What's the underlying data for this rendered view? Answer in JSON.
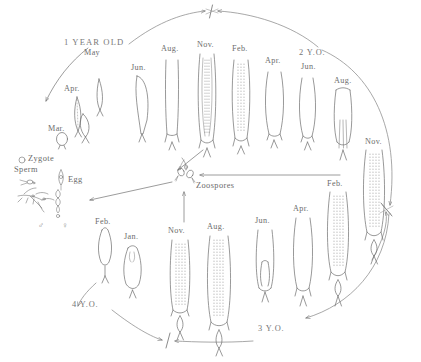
{
  "diagram": {
    "title_label": "1 YEAR OLD",
    "ink_color": "#6d6d6d",
    "background": "#ffffff"
  },
  "stage_labels": {
    "year1": "1 YEAR OLD",
    "year2": "2 Y.O.",
    "year3": "3 Y.O.",
    "year4": "4 Y.O."
  },
  "terms": {
    "zygote": "Zygote",
    "sperm": "Sperm",
    "egg": "Egg",
    "zoospores": "Zoospores",
    "male_symbol": "♂",
    "female_symbol": "♀"
  },
  "months": {
    "row_top": [
      "Mar.",
      "Apr.",
      "May",
      "Jun.",
      "Aug.",
      "Nov.",
      "Feb.",
      "Apr.",
      "Jun.",
      "Aug.",
      "Nov."
    ],
    "row_bottom": [
      "Feb.",
      "Jan.",
      "Nov.",
      "Aug.",
      "Jun.",
      "Apr.",
      "Feb."
    ]
  },
  "specimens": [
    {
      "id": "s-mar",
      "month": "Mar.",
      "x": 57,
      "y": 133,
      "w": 11,
      "h": 13,
      "shape": "blob",
      "row": "top"
    },
    {
      "id": "s-apr1",
      "month": "Apr.",
      "x": 72,
      "y": 96,
      "w": 10,
      "h": 34,
      "shape": "lance",
      "row": "top"
    },
    {
      "id": "s-may1",
      "month": "May",
      "x": 94,
      "y": 78,
      "w": 10,
      "h": 32,
      "shape": "lance",
      "row": "top"
    },
    {
      "id": "s-may2",
      "month": "May",
      "x": 76,
      "y": 113,
      "w": 14,
      "h": 26,
      "shape": "teardrop",
      "row": "top"
    },
    {
      "id": "s-jun1",
      "month": "Jun.",
      "x": 136,
      "y": 74,
      "w": 16,
      "h": 62,
      "shape": "blade",
      "row": "top"
    },
    {
      "id": "s-aug1",
      "month": "Aug.",
      "x": 166,
      "y": 58,
      "w": 16,
      "h": 84,
      "shape": "blade",
      "row": "top"
    },
    {
      "id": "s-nov1",
      "month": "Nov.",
      "x": 199,
      "y": 52,
      "w": 18,
      "h": 92,
      "shape": "sorus",
      "row": "top"
    },
    {
      "id": "s-feb1",
      "month": "Feb.",
      "x": 232,
      "y": 58,
      "w": 18,
      "h": 86,
      "shape": "sorus",
      "row": "top"
    },
    {
      "id": "s-apr2",
      "month": "Apr.",
      "x": 266,
      "y": 70,
      "w": 16,
      "h": 72,
      "shape": "blade",
      "row": "top"
    },
    {
      "id": "s-jun2",
      "month": "Jun.",
      "x": 300,
      "y": 76,
      "w": 14,
      "h": 68,
      "shape": "blade",
      "row": "top"
    },
    {
      "id": "s-aug2",
      "month": "Aug.",
      "x": 334,
      "y": 88,
      "w": 16,
      "h": 76,
      "shape": "split",
      "row": "top"
    },
    {
      "id": "s-nov2",
      "month": "Nov.",
      "x": 366,
      "y": 148,
      "w": 20,
      "h": 88,
      "shape": "sorus",
      "row": "right"
    },
    {
      "id": "s-feb2",
      "month": "Feb.",
      "x": 330,
      "y": 190,
      "w": 20,
      "h": 92,
      "shape": "sorus",
      "row": "bottom"
    },
    {
      "id": "s-apr3",
      "month": "Apr.",
      "x": 296,
      "y": 216,
      "w": 16,
      "h": 78,
      "shape": "blade",
      "row": "bottom"
    },
    {
      "id": "s-jun3",
      "month": "Jun.",
      "x": 258,
      "y": 228,
      "w": 16,
      "h": 72,
      "shape": "split",
      "row": "bottom"
    },
    {
      "id": "s-aug3",
      "month": "Aug.",
      "x": 210,
      "y": 234,
      "w": 20,
      "h": 96,
      "shape": "sorus",
      "row": "bottom"
    },
    {
      "id": "s-nov3",
      "month": "Nov.",
      "x": 172,
      "y": 238,
      "w": 18,
      "h": 82,
      "shape": "sorus",
      "row": "bottom"
    },
    {
      "id": "s-jan1",
      "month": "Jan.",
      "x": 125,
      "y": 244,
      "w": 16,
      "h": 48,
      "shape": "flask",
      "row": "bottom"
    },
    {
      "id": "s-feb3",
      "month": "Feb.",
      "x": 98,
      "y": 228,
      "w": 12,
      "h": 44,
      "shape": "flask",
      "row": "bottom"
    }
  ],
  "arrows": [
    {
      "id": "arc-top-left",
      "desc": "1-year arc sweeping up and right to year boundary"
    },
    {
      "id": "arc-top-right",
      "desc": "2-year arc sweeping left to year boundary"
    },
    {
      "id": "arc-right-outer",
      "desc": "outer right arc descending to 3-year boundary"
    },
    {
      "id": "arc-right-lower",
      "desc": "lower right arc rising to 3-year boundary"
    },
    {
      "id": "arc-bottom-left",
      "desc": "4-year arc sweeping right to bottom boundary"
    },
    {
      "id": "arc-bottom-right",
      "desc": "3-year arc sweeping left to bottom boundary"
    },
    {
      "id": "to-gametophyte",
      "desc": "arrow from 1 YEAR OLD down-left to gametophyte stage"
    },
    {
      "id": "sorus-to-spores",
      "desc": "arrow from Nov. sorus down-left to zoospores"
    },
    {
      "id": "spores-to-gam",
      "desc": "arrow from zoospores left-down to gametophytes"
    },
    {
      "id": "spores-up",
      "desc": "arrow rising into zoospores from below"
    },
    {
      "id": "spores-right",
      "desc": "arrow entering zoospores from the right"
    }
  ],
  "tick_marks": [
    {
      "id": "tick-top",
      "desc": "year boundary tick at top of cycle"
    },
    {
      "id": "tick-right",
      "desc": "year boundary tick at right of cycle"
    },
    {
      "id": "tick-bottom",
      "desc": "year boundary tick at bottom of cycle"
    }
  ]
}
